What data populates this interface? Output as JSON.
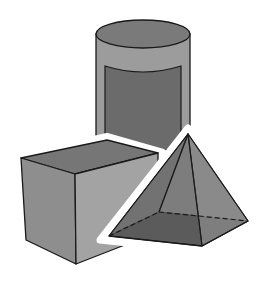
{
  "figure": {
    "title": "3D geometric solids",
    "shapes": [
      {
        "name": "cylinder"
      },
      {
        "name": "rectangular prism"
      },
      {
        "name": "square pyramid"
      }
    ]
  },
  "colors": {
    "background": "#ffffff",
    "outline": "#1a1a1a",
    "cylinder_side": "#9c9c9c",
    "cylinder_top": "#7a7a7a",
    "cylinder_panel": "#6b6b6b",
    "cube_top": "#767676",
    "cube_front": "#8e8e8e",
    "cube_right": "#a3a3a3",
    "pyramid_left": "#727272",
    "pyramid_right": "#8a8a8a",
    "pyramid_base": "#3e3e3e",
    "halo": "#ffffff"
  }
}
